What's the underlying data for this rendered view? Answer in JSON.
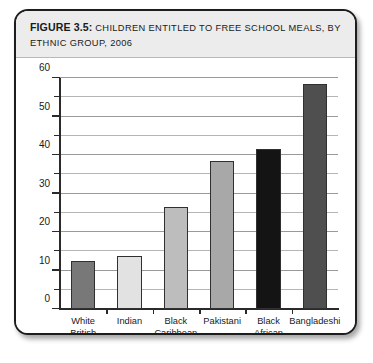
{
  "figure": {
    "label": "FIGURE 3.5:",
    "caption": "CHILDREN ENTITLED TO FREE SCHOOL MEALS, BY ETHNIC GROUP, 2006"
  },
  "chart_data": {
    "type": "bar",
    "xlabel": "",
    "ylabel": "",
    "categories": [
      "White British",
      "Indian",
      "Black Caribbean",
      "Pakistani",
      "Black African",
      "Bangladeshi"
    ],
    "category_lines": [
      [
        "White",
        "British"
      ],
      [
        "Indian"
      ],
      [
        "Black",
        "Caribbean"
      ],
      [
        "Pakistani"
      ],
      [
        "Black",
        "African"
      ],
      [
        "Bangladeshi"
      ]
    ],
    "values": [
      12.5,
      13.8,
      26.5,
      38.5,
      41.5,
      58.5
    ],
    "bar_colors": [
      "#787878",
      "#e2e2e2",
      "#bdbdbd",
      "#a8a8a8",
      "#141414",
      "#4f4f4f"
    ],
    "ylim": [
      0,
      60
    ],
    "ytick_labels": [
      "0",
      "10",
      "20",
      "30",
      "40",
      "50",
      "60"
    ],
    "ytick_values": [
      0,
      10,
      20,
      30,
      40,
      50,
      60
    ],
    "minor_tick_values": [
      5,
      15,
      25,
      35,
      45,
      55
    ],
    "grid": true,
    "legend": "none"
  }
}
